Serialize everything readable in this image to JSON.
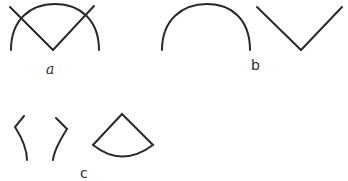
{
  "figure": {
    "panels": [
      {
        "id": "a",
        "label": "a",
        "description": "semicircular arc with a V crossing it",
        "parts": [
          "arc",
          "v-shape"
        ]
      },
      {
        "id": "b",
        "label": "b",
        "description": "arc and V-shape shown separately",
        "parts": [
          "arc",
          "v-shape"
        ]
      },
      {
        "id": "c",
        "label": "c",
        "description": "remaining pieces: two bent fragments and a sector (pie wedge)",
        "parts": [
          "left-fragment",
          "right-fragment",
          "sector"
        ]
      }
    ],
    "stroke_color": "#2a2a2a",
    "background": "#ffffff"
  }
}
